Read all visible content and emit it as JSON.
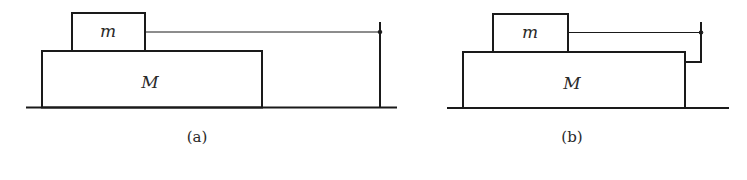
{
  "figure": {
    "panels": [
      {
        "id": "a",
        "caption": "(a)",
        "small_block_label": "m",
        "large_block_label": "M",
        "string_attachment": "fixed wall post"
      },
      {
        "id": "b",
        "caption": "(b)",
        "small_block_label": "m",
        "large_block_label": "M",
        "string_attachment": "post attached to block M"
      }
    ],
    "stroke_color": "#1a1a1a",
    "background_color": "#ffffff"
  }
}
